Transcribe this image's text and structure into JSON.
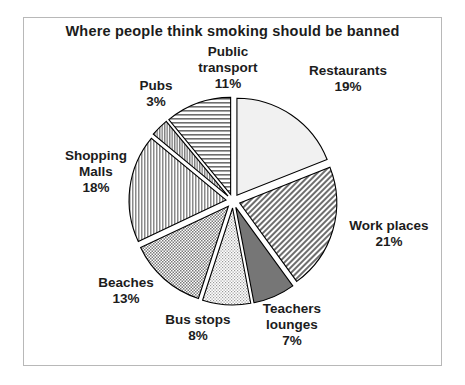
{
  "chart_data": {
    "type": "pie",
    "title": "Where people think smoking should be banned",
    "xlabel": "",
    "ylabel": "",
    "legend": "none",
    "grid": false,
    "exploded": true,
    "units": "percent",
    "categories": [
      "Restaurants",
      "Work places",
      "Teachers lounges",
      "Bus stops",
      "Beaches",
      "Shopping Malls",
      "Pubs",
      "Public transport"
    ],
    "values": [
      19,
      21,
      7,
      8,
      13,
      18,
      3,
      11
    ],
    "slices": [
      {
        "label": "Restaurants",
        "value": 19,
        "value_text": "19%",
        "fill": "#f0f0f0",
        "pattern": "solid-light",
        "start_angle": 0,
        "end_angle": 68.4
      },
      {
        "label": "Work places",
        "value": 21,
        "value_text": "21%",
        "fill": "#8f8f8f",
        "pattern": "diagonal-hatch",
        "start_angle": 68.4,
        "end_angle": 144.0
      },
      {
        "label": "Teachers lounges",
        "value": 7,
        "value_text": "7%",
        "fill": "#757575",
        "pattern": "solid-dark",
        "start_angle": 144.0,
        "end_angle": 169.2
      },
      {
        "label": "Bus stops",
        "value": 8,
        "value_text": "8%",
        "fill": "#dcdcdc",
        "pattern": "fine-stipple-light",
        "start_angle": 169.2,
        "end_angle": 198.0
      },
      {
        "label": "Beaches",
        "value": 13,
        "value_text": "13%",
        "fill": "#b0b0b0",
        "pattern": "fine-stipple",
        "start_angle": 198.0,
        "end_angle": 244.8
      },
      {
        "label": "Shopping Malls",
        "value": 18,
        "value_text": "18%",
        "fill": "#a8a8a8",
        "pattern": "vertical-hatch",
        "start_angle": 244.8,
        "end_angle": 309.6
      },
      {
        "label": "Pubs",
        "value": 3,
        "value_text": "3%",
        "fill": "#bdbdbd",
        "pattern": "vertical-hatch-dense",
        "start_angle": 309.6,
        "end_angle": 320.4
      },
      {
        "label": "Public transport",
        "value": 11,
        "value_text": "11%",
        "fill": "#e2e2e2",
        "pattern": "horizontal-hatch",
        "start_angle": 320.4,
        "end_angle": 360.0
      }
    ],
    "labels_display": [
      {
        "name": "restaurants",
        "text": "Restaurants\n19%"
      },
      {
        "name": "work-places",
        "text": "Work places\n21%"
      },
      {
        "name": "teachers-lounges",
        "text": "Teachers\nlounges\n7%"
      },
      {
        "name": "bus-stops",
        "text": "Bus stops\n8%"
      },
      {
        "name": "beaches",
        "text": "Beaches\n13%"
      },
      {
        "name": "shopping-malls",
        "text": "Shopping\nMalls\n18%"
      },
      {
        "name": "pubs",
        "text": "Pubs\n3%"
      },
      {
        "name": "public-transport",
        "text": "Public\ntransport\n11%"
      }
    ],
    "colors": {
      "border": "#b8b8b8",
      "text": "#1c1c1c",
      "background": "#ffffff",
      "slice_outline": "#000000"
    }
  }
}
